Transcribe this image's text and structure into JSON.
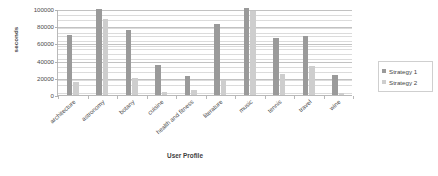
{
  "chart_data": {
    "type": "bar",
    "title": "",
    "subtitle": "",
    "xlabel": "User Profile",
    "ylabel": "seconds",
    "ylim": [
      0,
      100000
    ],
    "ytick_labels": [
      "100000",
      "80000",
      "60000",
      "40000",
      "20000",
      "0"
    ],
    "ytick_values": [
      100000,
      80000,
      60000,
      40000,
      20000,
      0
    ],
    "grid": true,
    "legend_position": "right",
    "categories": [
      "architecture",
      "astronomy",
      "botany",
      "cuisine",
      "health and fitness",
      "literature",
      "music",
      "tennis",
      "travel",
      "wine"
    ],
    "series": [
      {
        "name": "Strategy 1",
        "color": "#9a9a9a",
        "values": [
          71000,
          101000,
          77000,
          36000,
          23500,
          84000,
          102000,
          68000,
          70000,
          25000
        ]
      },
      {
        "name": "Strategy 2",
        "color": "#cecece",
        "values": [
          16000,
          89000,
          21500,
          4500,
          6500,
          19000,
          99000,
          26000,
          35000,
          4000
        ]
      }
    ]
  },
  "legend": {
    "entries": [
      {
        "label": "Strategy 1"
      },
      {
        "label": "Strategy 2"
      }
    ]
  }
}
